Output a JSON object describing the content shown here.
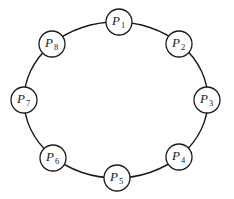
{
  "diagram": {
    "type": "ring",
    "ring": {
      "cx": 116,
      "cy": 100,
      "rx": 92,
      "ry": 78,
      "stroke": "#1a1a1a"
    },
    "node_radius": 13,
    "nodes": [
      {
        "id": "P1",
        "letter": "P",
        "sub": "1",
        "cx": 119,
        "cy": 22
      },
      {
        "id": "P2",
        "letter": "P",
        "sub": "2",
        "cx": 179,
        "cy": 44
      },
      {
        "id": "P3",
        "letter": "P",
        "sub": "3",
        "cx": 207,
        "cy": 100
      },
      {
        "id": "P4",
        "letter": "P",
        "sub": "4",
        "cx": 179,
        "cy": 157
      },
      {
        "id": "P5",
        "letter": "P",
        "sub": "5",
        "cx": 117,
        "cy": 178
      },
      {
        "id": "P6",
        "letter": "P",
        "sub": "6",
        "cx": 53,
        "cy": 158
      },
      {
        "id": "P7",
        "letter": "P",
        "sub": "7",
        "cx": 24,
        "cy": 100
      },
      {
        "id": "P8",
        "letter": "P",
        "sub": "8",
        "cx": 52,
        "cy": 44
      }
    ]
  }
}
